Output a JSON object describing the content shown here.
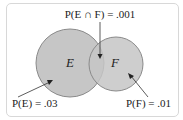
{
  "diagram": {
    "type": "venn",
    "sets": [
      {
        "name": "E",
        "label": "E",
        "probability_label": "P(E) = .03"
      },
      {
        "name": "F",
        "label": "F",
        "probability_label": "P(F) = .01"
      }
    ],
    "intersection_label": "P(E ∩ F) = .001",
    "colors": {
      "fill": "#c6c6c6",
      "stroke": "#8a8a8a",
      "frame": "#d8d8d8"
    }
  }
}
